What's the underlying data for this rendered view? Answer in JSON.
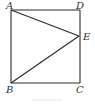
{
  "figure": {
    "stroke_color": "#2a2a2a",
    "points": {
      "A": {
        "label": "A",
        "x": 11,
        "y": 10
      },
      "D": {
        "label": "D",
        "x": 80,
        "y": 10
      },
      "E": {
        "label": "E",
        "x": 79,
        "y": 36
      },
      "B": {
        "label": "B",
        "x": 11,
        "y": 83
      },
      "C": {
        "label": "C",
        "x": 80,
        "y": 83
      }
    },
    "segments": [
      "AD",
      "DC",
      "CB",
      "BA",
      "AE",
      "BE"
    ],
    "shape": "square ABCD with point E on side DC, segments AE and BE"
  }
}
